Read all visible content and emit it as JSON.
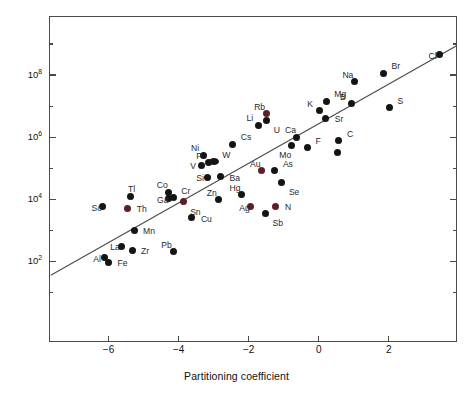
{
  "chart_data": {
    "type": "scatter",
    "title": "",
    "xlabel": "Partitioning coefficient",
    "ylabel": "Mean residence time (years)",
    "xlim": [
      -7.7,
      3.95
    ],
    "ylim_log10": [
      -0.6,
      9.9
    ],
    "yscale": "log",
    "xticks": [
      -6,
      -4,
      -2,
      0,
      2
    ],
    "xticklabels": [
      "−6",
      "−4",
      "−2",
      "0",
      "2"
    ],
    "yticks_major_log10": [
      2,
      4,
      6,
      8
    ],
    "yticklabels": [
      "10",
      "10",
      "10",
      "10"
    ],
    "yticks_exponents": [
      "2",
      "4",
      "6",
      "8"
    ],
    "yticks_minor_log10": [
      1,
      3,
      5,
      7,
      9
    ],
    "grid": false,
    "legend": false,
    "trendline": {
      "label": "regression line",
      "x_start": -7.65,
      "y_start_log10": 1.55,
      "x_end": 3.95,
      "y_end_log10": 8.95
    },
    "points": [
      {
        "label": "Al",
        "x": -6.12,
        "y_log10": 2.12,
        "color": "#141414",
        "label_pos": "left"
      },
      {
        "label": "Fe",
        "x": -6.0,
        "y_log10": 1.97,
        "color": "#141414",
        "label_pos": "right"
      },
      {
        "label": "Sc",
        "x": -6.17,
        "y_log10": 3.76,
        "color": "#141414",
        "label_pos": "left"
      },
      {
        "label": "La",
        "x": -5.64,
        "y_log10": 2.48,
        "color": "#141414",
        "label_pos": "left"
      },
      {
        "label": "Th",
        "x": -5.45,
        "y_log10": 3.7,
        "color": "#5e1f24",
        "label_pos": "right"
      },
      {
        "label": "Tl",
        "x": -5.36,
        "y_log10": 4.08,
        "color": "#141414",
        "label_pos": "top"
      },
      {
        "label": "Zr",
        "x": -5.33,
        "y_log10": 2.35,
        "color": "#141414",
        "label_pos": "right"
      },
      {
        "label": "Mn",
        "x": -5.27,
        "y_log10": 3.0,
        "color": "#141414",
        "label_pos": "right"
      },
      {
        "label": "Pb",
        "x": -4.15,
        "y_log10": 2.3,
        "color": "#141414",
        "label_pos": "topleft"
      },
      {
        "label": "Ga",
        "x": -4.3,
        "y_log10": 4.02,
        "color": "#141414",
        "label_pos": "left"
      },
      {
        "label": "Co",
        "x": -4.28,
        "y_log10": 4.23,
        "color": "#141414",
        "label_pos": "topleft"
      },
      {
        "label": "Cr",
        "x": -4.15,
        "y_log10": 4.05,
        "color": "#141414",
        "label_pos": "topright"
      },
      {
        "label": "Sn",
        "x": -3.87,
        "y_log10": 3.92,
        "color": "#5e1f24",
        "label_pos": "bottomright"
      },
      {
        "label": "Cu",
        "x": -3.62,
        "y_log10": 3.4,
        "color": "#141414",
        "label_pos": "right"
      },
      {
        "label": "V",
        "x": -3.35,
        "y_log10": 5.1,
        "color": "#141414",
        "label_pos": "left"
      },
      {
        "label": "Ni",
        "x": -3.3,
        "y_log10": 5.42,
        "color": "#141414",
        "label_pos": "topleft"
      },
      {
        "label": "P",
        "x": -3.15,
        "y_log10": 5.17,
        "color": "#141414",
        "label_pos": "topleft"
      },
      {
        "label": "Si",
        "x": -3.18,
        "y_log10": 4.7,
        "color": "#141414",
        "label_pos": "left"
      },
      {
        "label": "W",
        "x": -2.98,
        "y_log10": 5.2,
        "color": "#141414",
        "label_pos": "topright",
        "wide": true
      },
      {
        "label": "Zn",
        "x": -2.85,
        "y_log10": 3.98,
        "color": "#141414",
        "label_pos": "topleft"
      },
      {
        "label": "Ba",
        "x": -2.8,
        "y_log10": 4.72,
        "color": "#141414",
        "label_pos": "right"
      },
      {
        "label": "Cs",
        "x": -2.45,
        "y_log10": 5.77,
        "color": "#141414",
        "label_pos": "topright"
      },
      {
        "label": "Hg",
        "x": -2.2,
        "y_log10": 4.15,
        "color": "#141414",
        "label_pos": "topleft"
      },
      {
        "label": "Ag",
        "x": -1.95,
        "y_log10": 3.75,
        "color": "#5e1f24",
        "label_pos": "left"
      },
      {
        "label": "Li",
        "x": -1.72,
        "y_log10": 6.38,
        "color": "#141414",
        "label_pos": "topleft"
      },
      {
        "label": "Au",
        "x": -1.62,
        "y_log10": 4.92,
        "color": "#5e1f24",
        "label_pos": "topleft"
      },
      {
        "label": "Rb",
        "x": -1.5,
        "y_log10": 6.75,
        "color": "#5e1f24",
        "label_pos": "topleft"
      },
      {
        "label": "U",
        "x": -1.48,
        "y_log10": 6.55,
        "color": "#141414",
        "label_pos": "bottomright"
      },
      {
        "label": "Sb",
        "x": -1.52,
        "y_log10": 3.55,
        "color": "#141414",
        "label_pos": "bottomright"
      },
      {
        "label": "As",
        "x": -1.25,
        "y_log10": 4.92,
        "color": "#141414",
        "label_pos": "topright"
      },
      {
        "label": "N",
        "x": -1.22,
        "y_log10": 3.78,
        "color": "#5e1f24",
        "label_pos": "right"
      },
      {
        "label": "Se",
        "x": -1.05,
        "y_log10": 4.55,
        "color": "#141414",
        "label_pos": "bottomright"
      },
      {
        "label": "Mo",
        "x": -0.78,
        "y_log10": 5.73,
        "color": "#141414",
        "label_pos": "bottomleft"
      },
      {
        "label": "Ca",
        "x": -0.62,
        "y_log10": 6.0,
        "color": "#141414",
        "label_pos": "topleft"
      },
      {
        "label": "F",
        "x": -0.32,
        "y_log10": 5.66,
        "color": "#141414",
        "label_pos": "topright"
      },
      {
        "label": "K",
        "x": 0.02,
        "y_log10": 6.85,
        "color": "#141414",
        "label_pos": "topleft"
      },
      {
        "label": "Sr",
        "x": 0.2,
        "y_log10": 6.6,
        "color": "#141414",
        "label_pos": "right"
      },
      {
        "label": "Mg",
        "x": 0.22,
        "y_log10": 7.15,
        "color": "#141414",
        "label_pos": "topright"
      },
      {
        "label": "C",
        "x": 0.58,
        "y_log10": 5.88,
        "color": "#141414",
        "label_pos": "topright"
      },
      {
        "label": "",
        "x": 0.55,
        "y_log10": 5.5,
        "color": "#141414",
        "label_pos": "none"
      },
      {
        "label": "B",
        "x": 0.95,
        "y_log10": 7.08,
        "color": "#141414",
        "label_pos": "topleft"
      },
      {
        "label": "Na",
        "x": 1.02,
        "y_log10": 7.78,
        "color": "#141414",
        "label_pos": "topleft"
      },
      {
        "label": "Br",
        "x": 1.85,
        "y_log10": 8.05,
        "color": "#141414",
        "label_pos": "topright"
      },
      {
        "label": "S",
        "x": 2.02,
        "y_log10": 6.95,
        "color": "#141414",
        "label_pos": "topright"
      },
      {
        "label": "Cl",
        "x": 3.45,
        "y_log10": 8.65,
        "color": "#141414",
        "label_pos": "left"
      }
    ]
  }
}
